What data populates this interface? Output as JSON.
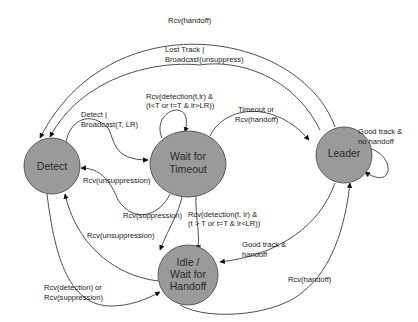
{
  "diagram": {
    "type": "state-machine",
    "colors": {
      "node_fill": "#9a9a9a",
      "node_stroke": "#5a5a5a",
      "edge": "#3a3a3a",
      "background": "#ffffff"
    },
    "nodes": {
      "detect": {
        "line1": "Detect"
      },
      "wait_timeout": {
        "line1": "Wait for",
        "line2": "Timeout"
      },
      "leader": {
        "line1": "Leader"
      },
      "idle": {
        "line1": "Idle /",
        "line2": "Wait for",
        "line3": "Handoff"
      }
    },
    "edges": {
      "leader_to_detect_handoff": {
        "from": "Leader",
        "to": "Detect",
        "l1": "Rcv(handoff)"
      },
      "leader_to_detect_lost": {
        "from": "Leader",
        "to": "Detect",
        "l1": "Lost Track |",
        "l2": "Broadcast(unsuppress)"
      },
      "wait_self": {
        "from": "Wait for Timeout",
        "to": "Wait for Timeout",
        "l1": "Rcv(detection(t,lr) &",
        "l2": "(t<T or t=T & lr>LR))"
      },
      "detect_to_wait": {
        "from": "Detect",
        "to": "Wait for Timeout",
        "l1": "Detect |",
        "l2": "Broadcast(T, LR)"
      },
      "wait_to_leader": {
        "from": "Wait for Timeout",
        "to": "Leader",
        "l1": "Timeout or",
        "l2": "Rcv(handoff)"
      },
      "leader_self": {
        "from": "Leader",
        "to": "Leader",
        "l1": "Good track &",
        "l2": "no handoff"
      },
      "wait_to_detect": {
        "from": "Wait for Timeout",
        "to": "Detect",
        "l1": "Rcv(unsuppression)"
      },
      "wait_to_idle": {
        "from": "Wait for Timeout",
        "to": "Idle / Wait for Handoff",
        "l1": "Rcv(suppression)"
      },
      "idle_self": {
        "from": "Idle / Wait for Handoff",
        "to": "Idle / Wait for Handoff",
        "l1": "Rcv(detection(t, lr) &",
        "l2": "(t > T or  t=T & lr<LR))"
      },
      "idle_to_detect": {
        "from": "Idle / Wait for Handoff",
        "to": "Detect",
        "l1": "Rcv(unsuppression)"
      },
      "leader_to_idle": {
        "from": "Leader",
        "to": "Idle / Wait for Handoff",
        "l1": "Good track &",
        "l2": "handoff"
      },
      "detect_to_idle": {
        "from": "Detect",
        "to": "Idle / Wait for Handoff",
        "l1": "Rcv(detection) or",
        "l2": "Rcv(suppression)"
      },
      "idle_to_leader": {
        "from": "Idle / Wait for Handoff",
        "to": "Leader",
        "l1": "Rcv(handoff)"
      }
    }
  }
}
